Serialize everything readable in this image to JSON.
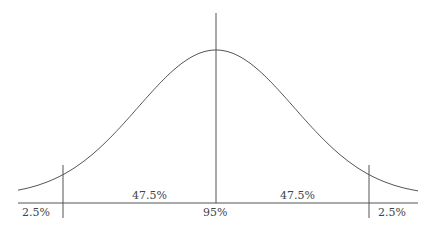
{
  "diagram": {
    "type": "normal-distribution",
    "labels": {
      "left_tail": "2.5%",
      "left_center": "47.5%",
      "center": "95%",
      "right_center": "47.5%",
      "right_tail": "2.5%"
    },
    "std_dev_cutoff": 1.96,
    "colors": {
      "line": "#555555",
      "text": "#444444"
    }
  }
}
